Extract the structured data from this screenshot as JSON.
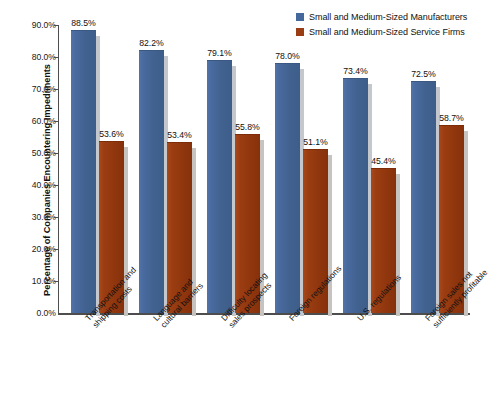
{
  "chart_data": {
    "type": "bar",
    "title": "",
    "xlabel": "",
    "ylabel": "Percentage of Companies Encountering Impediments",
    "ylim": [
      0,
      90
    ],
    "ytick_labels": [
      "90.0%",
      "80.0%",
      "70.0%",
      "60.0%",
      "50.0%",
      "40.0%",
      "30.0%",
      "20.0%",
      "10.0%",
      "0.0%"
    ],
    "ytick_values": [
      90,
      80,
      70,
      60,
      50,
      40,
      30,
      20,
      10,
      0
    ],
    "grid": false,
    "legend_position": "top-right",
    "categories": [
      "Transportation and shipping costs",
      "Language and cultural barriers",
      "Difficulty locating sales prospects",
      "Foreign regulations",
      "U.S. regulations",
      "Foreign sales not sufficiently profitable"
    ],
    "category_lines": [
      [
        "Transportation and",
        "shipping costs"
      ],
      [
        "Language and",
        "cultural barriers"
      ],
      [
        "Difficulty locating",
        "sales prospects"
      ],
      [
        "Foreign regulations",
        ""
      ],
      [
        "U.S. regulations",
        ""
      ],
      [
        "Foreign sales not",
        "sufficiently profitable"
      ]
    ],
    "series": [
      {
        "name": "Small and Medium-Sized Manufacturers",
        "color": "#44679c",
        "values": [
          88.5,
          82.2,
          79.1,
          78.0,
          73.4,
          72.5
        ],
        "labels": [
          "88.5%",
          "82.2%",
          "79.1%",
          "78.0%",
          "73.4%",
          "72.5%"
        ]
      },
      {
        "name": "Small and Medium-Sized Service Firms",
        "color": "#9b3d12",
        "values": [
          53.6,
          53.4,
          55.8,
          51.1,
          45.4,
          58.7
        ],
        "labels": [
          "53.6%",
          "53.4%",
          "55.8%",
          "51.1%",
          "45.4%",
          "58.7%"
        ]
      }
    ]
  },
  "legend": {
    "items": [
      {
        "label": "Small and Medium-Sized Manufacturers",
        "color": "#44679c"
      },
      {
        "label": "Small and Medium-Sized Service Firms",
        "color": "#9b3d12"
      }
    ]
  }
}
